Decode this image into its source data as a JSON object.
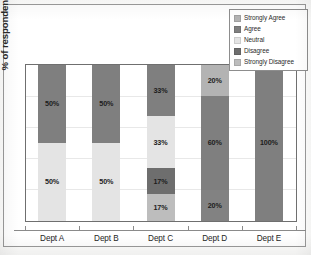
{
  "chart_data": {
    "type": "bar",
    "subtype": "stacked-bar-100-percent",
    "title": "",
    "xlabel": "",
    "ylabel": "% of respondents",
    "ylim": [
      0,
      100
    ],
    "grid": true,
    "legend_position": "top-right",
    "categories": [
      "Dept A",
      "Dept B",
      "Dept C",
      "Dept D",
      "Dept E"
    ],
    "series": [
      {
        "name": "Strongly Agree",
        "color": "#b3b3b3",
        "values": [
          0,
          0,
          0,
          20,
          0
        ],
        "labels": [
          "",
          "",
          "",
          "20%",
          ""
        ]
      },
      {
        "name": "Agree",
        "color": "#7f7f7f",
        "values": [
          50,
          50,
          33,
          60,
          100
        ],
        "labels": [
          "50%",
          "50%",
          "33%",
          "60%",
          "100%"
        ]
      },
      {
        "name": "Neutral",
        "color": "#e4e4e4",
        "values": [
          50,
          50,
          33,
          0,
          0
        ],
        "labels": [
          "50%",
          "50%",
          "33%",
          "",
          ""
        ]
      },
      {
        "name": "Disagree",
        "color": "#6e6e6e",
        "values": [
          0,
          0,
          17,
          0,
          0
        ],
        "labels": [
          "",
          "",
          "17%",
          "",
          ""
        ]
      },
      {
        "name": "Strongly Disagree",
        "color": "#bdbdbd",
        "values": [
          0,
          0,
          17,
          20,
          0
        ],
        "labels": [
          "",
          "",
          "17%",
          "20%",
          ""
        ]
      }
    ],
    "stack_order_top_to_bottom": [
      "Strongly Agree",
      "Agree",
      "Neutral",
      "Disagree",
      "Strongly Disagree"
    ],
    "columns": [
      {
        "category": "Dept A",
        "segments": [
          {
            "name": "Agree",
            "value": 50,
            "label": "50%",
            "color": "#7f7f7f"
          },
          {
            "name": "Neutral",
            "value": 50,
            "label": "50%",
            "color": "#e4e4e4"
          }
        ]
      },
      {
        "category": "Dept B",
        "segments": [
          {
            "name": "Agree",
            "value": 50,
            "label": "50%",
            "color": "#7f7f7f"
          },
          {
            "name": "Neutral",
            "value": 50,
            "label": "50%",
            "color": "#e4e4e4"
          }
        ]
      },
      {
        "category": "Dept C",
        "segments": [
          {
            "name": "Agree",
            "value": 33,
            "label": "33%",
            "color": "#7f7f7f"
          },
          {
            "name": "Neutral",
            "value": 33,
            "label": "33%",
            "color": "#e4e4e4"
          },
          {
            "name": "Disagree",
            "value": 17,
            "label": "17%",
            "color": "#6e6e6e"
          },
          {
            "name": "Strongly Disagree",
            "value": 17,
            "label": "17%",
            "color": "#bdbdbd"
          }
        ]
      },
      {
        "category": "Dept D",
        "segments": [
          {
            "name": "Strongly Agree",
            "value": 20,
            "label": "20%",
            "color": "#b3b3b3"
          },
          {
            "name": "Agree",
            "value": 60,
            "label": "60%",
            "color": "#7f7f7f"
          },
          {
            "name": "Strongly Disagree",
            "value": 20,
            "label": "20%",
            "color": "#828282"
          }
        ]
      },
      {
        "category": "Dept E",
        "segments": [
          {
            "name": "Agree",
            "value": 100,
            "label": "100%",
            "color": "#7f7f7f"
          }
        ]
      }
    ]
  },
  "legend": {
    "items": [
      {
        "label": "Strongly Agree",
        "color": "#b3b3b3"
      },
      {
        "label": "Agree",
        "color": "#7f7f7f"
      },
      {
        "label": "Neutral",
        "color": "#e4e4e4"
      },
      {
        "label": "Disagree",
        "color": "#6e6e6e"
      },
      {
        "label": "Strongly Disagree",
        "color": "#bdbdbd"
      }
    ]
  }
}
